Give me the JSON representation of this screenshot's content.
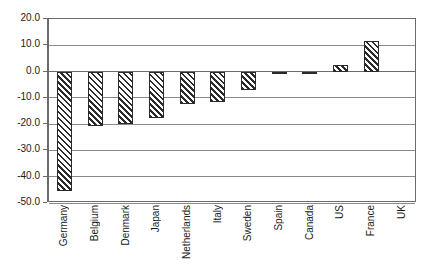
{
  "chart_data": {
    "type": "bar",
    "title": "",
    "subtitle": "",
    "xlabel": "",
    "ylabel": "",
    "ylim": [
      -50.0,
      20.0
    ],
    "ytick_step": 10.0,
    "yticks": [
      "20.0",
      "10.0",
      "0.0",
      "-10.0",
      "-20.0",
      "-30.0",
      "-40.0",
      "-50.0"
    ],
    "ytick_values": [
      20.0,
      10.0,
      0.0,
      -10.0,
      -20.0,
      -30.0,
      -40.0,
      -50.0
    ],
    "grid": true,
    "grid_axis": "y",
    "legend": false,
    "legend_position": "none",
    "bar_fill": "diagonal-hatch",
    "bar_edge_color": "#2a2a2a",
    "bar_hatch_color": "#2b2b2b",
    "plot_border_color": "#6b6b6b",
    "gridline_color": "#8a8a8a",
    "categories": [
      "Germany",
      "Belgium",
      "Denmark",
      "Japan",
      "Netherlands",
      "Italy",
      "Sweden",
      "Spain",
      "Canada",
      "US",
      "France",
      "UK"
    ],
    "values": [
      -45.5,
      -20.8,
      -19.8,
      -17.8,
      -12.3,
      -11.5,
      -7.0,
      -0.5,
      -0.3,
      2.5,
      11.8,
      0.0
    ]
  }
}
